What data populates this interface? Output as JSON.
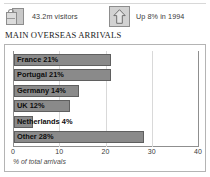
{
  "stats": [
    {
      "icon": "suitcase-icon",
      "label": "43.2m visitors"
    },
    {
      "icon": "up-arrow-icon",
      "label": "Up 8% in 1994"
    }
  ],
  "heading": "MAIN OVERSEAS ARRIVALS",
  "colors": {
    "bar_fill": "#8a8a8a",
    "bar_border": "#5f5f5f",
    "frame_border": "#b4b4b4",
    "gridline": "#d9d9d9",
    "axis": "#8f8f8f"
  },
  "chart_data": {
    "type": "bar",
    "orientation": "horizontal",
    "title": "MAIN OVERSEAS ARRIVALS",
    "xlabel": "% of total arrivals",
    "ylabel": "",
    "categories": [
      "France",
      "Portugal",
      "Germany",
      "UK",
      "Netherlands",
      "Other"
    ],
    "values": [
      21,
      21,
      14,
      12,
      4,
      28
    ],
    "bar_labels": [
      "France 21%",
      "Portugal 21%",
      "Germany 14%",
      "UK 12%",
      "Netherlands 4%",
      "Other 28%"
    ],
    "xlim": [
      0,
      40
    ],
    "xticks": [
      0,
      10,
      20,
      30,
      40
    ],
    "xtick_labels": [
      "0",
      "10",
      "20",
      "30",
      "40"
    ],
    "grid": true,
    "legend": false
  }
}
